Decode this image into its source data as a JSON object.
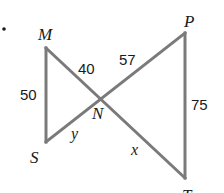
{
  "diagram": {
    "type": "geometry-figure",
    "colors": {
      "line": "#7a7a7a",
      "text": "#1a1a1a",
      "background": "#ffffff"
    },
    "bullet": "•",
    "vertices": {
      "M": {
        "label": "M",
        "x": 46,
        "y": 48
      },
      "N": {
        "label": "N",
        "x": 99,
        "y": 99
      },
      "P": {
        "label": "P",
        "x": 185,
        "y": 33
      },
      "S": {
        "label": "S",
        "x": 47,
        "y": 142
      },
      "T": {
        "label": "T",
        "x": 185,
        "y": 178
      }
    },
    "segments": [
      {
        "from": "M",
        "to": "S",
        "length_label": "50"
      },
      {
        "from": "M",
        "to": "N",
        "length_label": "40"
      },
      {
        "from": "N",
        "to": "P",
        "length_label": "57"
      },
      {
        "from": "P",
        "to": "T",
        "length_label": "75"
      },
      {
        "from": "S",
        "to": "N",
        "length_label": "y"
      },
      {
        "from": "N",
        "to": "T",
        "length_label": "x"
      }
    ],
    "measurements": {
      "MS": "50",
      "MN": "40",
      "NP": "57",
      "PT": "75",
      "SN": "y",
      "NT": "x"
    }
  }
}
